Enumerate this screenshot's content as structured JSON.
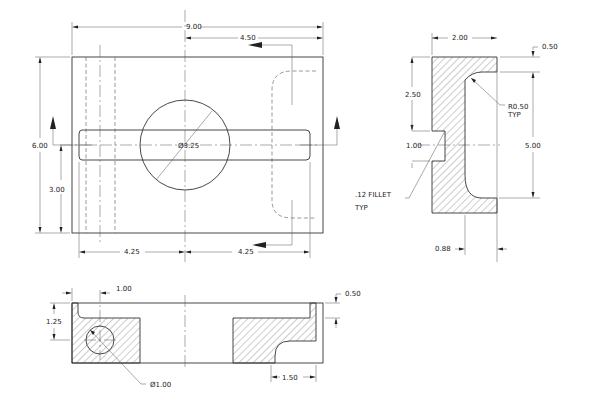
{
  "front_view": {
    "dims": {
      "overall_width": "9.00",
      "half_width": "4.50",
      "height": "6.00",
      "slot_center_height": "3.00",
      "left_half": "4.25",
      "right_half": "4.25",
      "bore_diameter": "Ø3.25"
    }
  },
  "side_view": {
    "dims": {
      "width": "2.00",
      "top_thickness": "0.50",
      "upper_height": "2.50",
      "slot_height": "1.00",
      "inner_height": "5.00",
      "wall_offset": "0.88"
    },
    "notes": {
      "radius_note_line1": "R0.50",
      "radius_note_line2": "TYP",
      "fillet_note_line1": ".12 FILLET",
      "fillet_note_line2": "TYP"
    }
  },
  "bottom_view": {
    "dims": {
      "hole_offset": "1.00",
      "flange_height": "1.25",
      "top_thickness": "0.50",
      "step_width": "1.50",
      "hole_diameter": "Ø1.00"
    }
  },
  "colors": {
    "line": "#333333",
    "background": "#ffffff"
  }
}
